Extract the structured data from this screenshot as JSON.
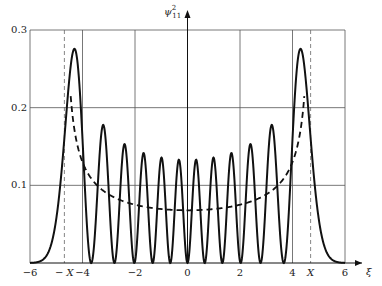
{
  "chart_data": {
    "type": "line",
    "title": "",
    "ylabel": "ψ²₁₁",
    "ylabel_main": "ψ",
    "ylabel_sup": "2",
    "ylabel_sub": "11",
    "xlabel": "ξ",
    "xlim": [
      -6,
      6
    ],
    "ylim": [
      0,
      0.3
    ],
    "grid": true,
    "x_ticks": [
      {
        "value": -6,
        "label": "−6"
      },
      {
        "value": -4.69,
        "label": "− X"
      },
      {
        "value": -4,
        "label": "−4"
      },
      {
        "value": -2,
        "label": "−2"
      },
      {
        "value": 0,
        "label": "0"
      },
      {
        "value": 2,
        "label": "2"
      },
      {
        "value": 4,
        "label": "4"
      },
      {
        "value": 4.69,
        "label": "X"
      },
      {
        "value": 6,
        "label": "6"
      }
    ],
    "y_ticks": [
      {
        "value": 0.1,
        "label": "0.1"
      },
      {
        "value": 0.2,
        "label": "0.2"
      },
      {
        "value": 0.3,
        "label": "0.3"
      }
    ],
    "vertical_gridlines": [
      -4,
      -2,
      2,
      4
    ],
    "horizontal_gridlines": [
      0.1,
      0.2,
      0.3
    ],
    "dashed_markers": [
      {
        "value": -4.69,
        "label": "-X"
      },
      {
        "value": 4.69,
        "label": "X"
      }
    ],
    "series": [
      {
        "name": "quantum probability density ψ²₁₁",
        "style": "solid",
        "quantum_number": 11,
        "peaks": [
          {
            "x": -4.5,
            "y": 0.272
          },
          {
            "x": -3.3,
            "y": 0.178
          },
          {
            "x": -2.55,
            "y": 0.153
          },
          {
            "x": -1.9,
            "y": 0.142
          },
          {
            "x": -1.25,
            "y": 0.137
          },
          {
            "x": -0.62,
            "y": 0.134
          },
          {
            "x": 0.62,
            "y": 0.134
          },
          {
            "x": 1.25,
            "y": 0.137
          },
          {
            "x": 1.9,
            "y": 0.142
          },
          {
            "x": 2.55,
            "y": 0.153
          },
          {
            "x": 3.3,
            "y": 0.178
          },
          {
            "x": 4.5,
            "y": 0.272
          }
        ]
      },
      {
        "name": "classical probability density",
        "style": "dashed",
        "formula": "1/(π·sqrt(X²−ξ²))",
        "X": 4.69,
        "x_range": [
          -4.45,
          4.45
        ],
        "points": [
          {
            "x": -4.45,
            "y": 0.19
          },
          {
            "x": -4.0,
            "y": 0.13
          },
          {
            "x": -3.0,
            "y": 0.088
          },
          {
            "x": -2.0,
            "y": 0.075
          },
          {
            "x": 0,
            "y": 0.068
          },
          {
            "x": 2.0,
            "y": 0.075
          },
          {
            "x": 3.0,
            "y": 0.088
          },
          {
            "x": 4.0,
            "y": 0.13
          },
          {
            "x": 4.45,
            "y": 0.19
          }
        ]
      }
    ]
  },
  "colors": {
    "curve": "#111111",
    "grid": "#555555",
    "axis": "#111111",
    "background": "#ffffff"
  }
}
